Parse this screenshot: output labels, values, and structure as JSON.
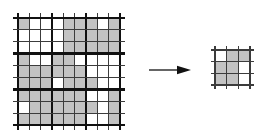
{
  "figure": {
    "background": "#ffffff",
    "colors": {
      "shaded": "#c3c3c3",
      "thin_line": "#3c3c3c",
      "thick_line": "#111111",
      "arrow": "#111111"
    },
    "big_grid": {
      "rows": 9,
      "cols": 9,
      "thick_every": 3,
      "cells": [
        "100011101",
        "000011111",
        "000011111",
        "100110000",
        "111111000",
        "111011100",
        "111111001",
        "011111101",
        "111111001"
      ]
    },
    "arrow": {
      "direction": "right"
    },
    "small_grid": {
      "rows": 3,
      "cols": 3,
      "thick_every": 0,
      "cells": [
        "011",
        "110",
        "110"
      ]
    }
  }
}
